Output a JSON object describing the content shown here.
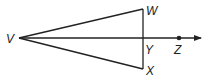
{
  "diagram": {
    "type": "geometry",
    "stroke_color": "#222222",
    "points": {
      "V": {
        "label": "V",
        "x": 19,
        "y": 38
      },
      "W": {
        "label": "W",
        "x": 143,
        "y": 9
      },
      "X": {
        "label": "X",
        "x": 143,
        "y": 69
      },
      "Y": {
        "label": "Y",
        "x": 143,
        "y": 38
      },
      "Z": {
        "label": "Z",
        "x": 179,
        "y": 38
      }
    },
    "segments": [
      "VW",
      "VX",
      "WX"
    ],
    "rays": [
      {
        "from": "V",
        "through": "Z"
      }
    ]
  }
}
